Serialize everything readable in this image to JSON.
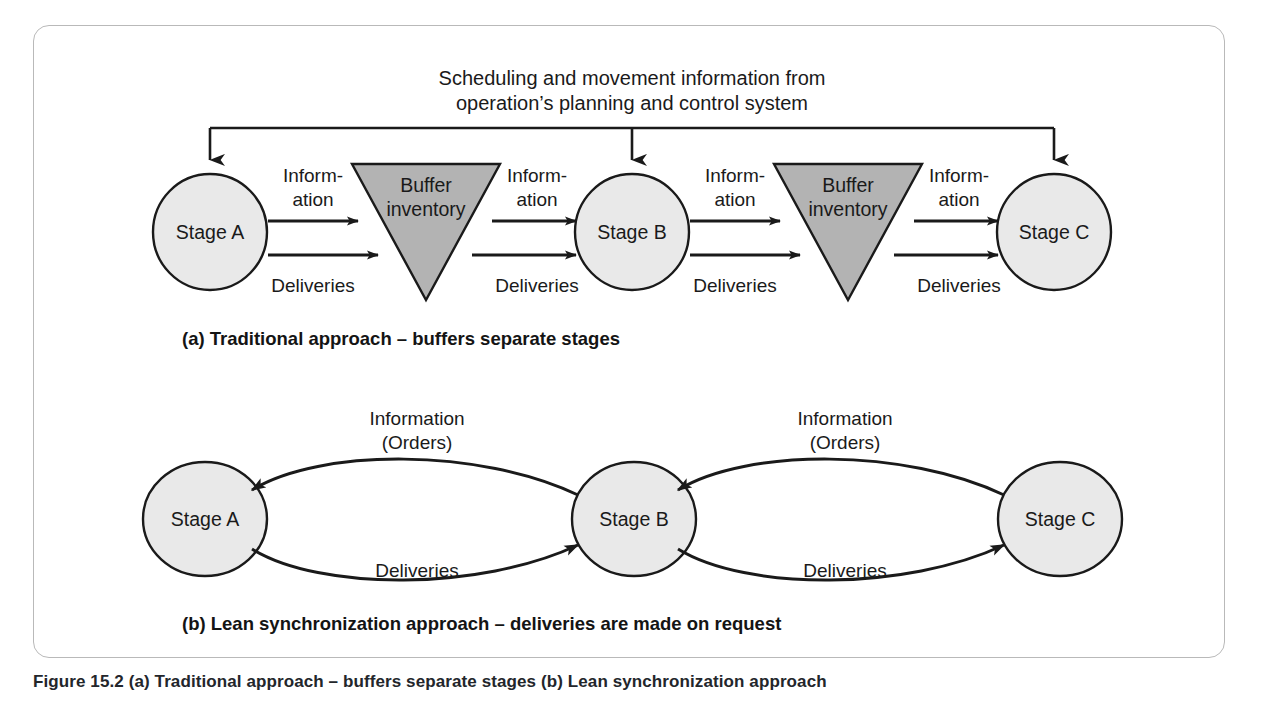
{
  "figure": {
    "number_label": "Figure 15.2",
    "bottom_caption": "Figure 15.2 (a) Traditional approach – buffers separate stages (b) Lean synchronization approach"
  },
  "panel_a": {
    "header_line1": "Scheduling and movement information from",
    "header_line2": "operation’s planning and control system",
    "caption": "(a) Traditional approach – buffers separate stages",
    "nodes": [
      {
        "id": "stage-a",
        "label": "Stage A",
        "type": "circle"
      },
      {
        "id": "buffer-1",
        "label_line1": "Buffer",
        "label_line2": "inventory",
        "type": "triangle"
      },
      {
        "id": "stage-b",
        "label": "Stage B",
        "type": "circle"
      },
      {
        "id": "buffer-2",
        "label_line1": "Buffer",
        "label_line2": "inventory",
        "type": "triangle"
      },
      {
        "id": "stage-c",
        "label": "Stage C",
        "type": "circle"
      }
    ],
    "flow_labels": [
      {
        "id": "info-1",
        "line1": "Inform-",
        "line2": "ation"
      },
      {
        "id": "info-2",
        "line1": "Inform-",
        "line2": "ation"
      },
      {
        "id": "info-3",
        "line1": "Inform-",
        "line2": "ation"
      },
      {
        "id": "info-4",
        "line1": "Inform-",
        "line2": "ation"
      }
    ],
    "delivery_labels": [
      {
        "id": "deliveries-1",
        "text": "Deliveries"
      },
      {
        "id": "deliveries-2",
        "text": "Deliveries"
      },
      {
        "id": "deliveries-3",
        "text": "Deliveries"
      },
      {
        "id": "deliveries-4",
        "text": "Deliveries"
      }
    ]
  },
  "panel_b": {
    "caption": "(b) Lean synchronization approach – deliveries are made on request",
    "nodes": [
      {
        "id": "stage-a",
        "label": "Stage A"
      },
      {
        "id": "stage-b",
        "label": "Stage B"
      },
      {
        "id": "stage-c",
        "label": "Stage C"
      }
    ],
    "arc_labels": [
      {
        "id": "info-orders-1",
        "line1": "Information",
        "line2": "(Orders)"
      },
      {
        "id": "info-orders-2",
        "line1": "Information",
        "line2": "(Orders)"
      }
    ],
    "delivery_labels": [
      {
        "id": "deliveries-1",
        "text": "Deliveries"
      },
      {
        "id": "deliveries-2",
        "text": "Deliveries"
      }
    ]
  },
  "colors": {
    "circle_fill": "#e9e9e9",
    "triangle_fill": "#b3b3b3",
    "stroke": "#1a1a1a",
    "panel_border": "#b9b9b9",
    "text": "#1a1a1a",
    "background": "#ffffff"
  }
}
